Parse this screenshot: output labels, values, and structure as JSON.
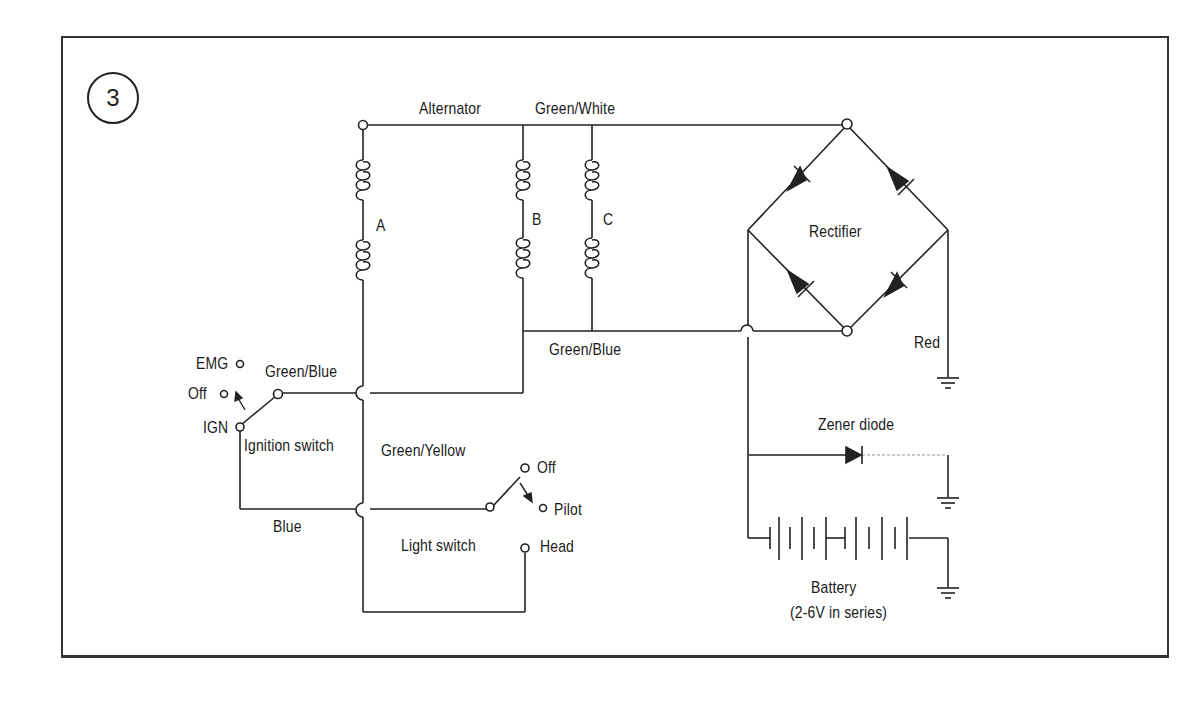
{
  "figure": {
    "number": "3"
  },
  "labels": {
    "alternator": "Alternator",
    "green_white": "Green/White",
    "coil_a": "A",
    "coil_b": "B",
    "coil_c": "C",
    "rectifier": "Rectifier",
    "green_blue_main": "Green/Blue",
    "red": "Red",
    "emg": "EMG",
    "ign_off": "Off",
    "ign": "IGN",
    "green_blue_switch": "Green/Blue",
    "ignition_switch": "Ignition switch",
    "green_yellow": "Green/Yellow",
    "light_off": "Off",
    "pilot": "Pilot",
    "head": "Head",
    "blue": "Blue",
    "light_switch": "Light switch",
    "zener_diode": "Zener diode",
    "battery": "Battery",
    "battery_spec": "(2-6V in series)"
  }
}
